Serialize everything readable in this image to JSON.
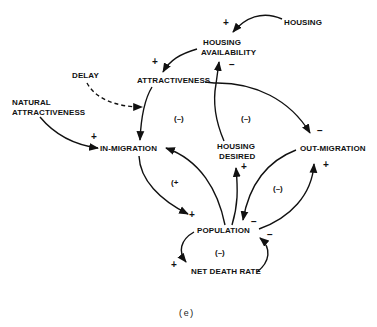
{
  "diagram": {
    "type": "causal-loop-diagram",
    "caption": "(e)",
    "nodes": {
      "housing": "HOUSING",
      "housing_availability_1": "HOUSING",
      "housing_availability_2": "AVAILABILITY",
      "attractiveness": "ATTRACTIVENESS",
      "delay": "DELAY",
      "natural_attractiveness_1": "NATURAL",
      "natural_attractiveness_2": "ATTRACTIVENESS",
      "in_migration": "IN-MIGRATION",
      "housing_desired_1": "HOUSING",
      "housing_desired_2": "DESIRED",
      "out_migration": "OUT-MIGRATION",
      "population": "POPULATION",
      "net_death_rate": "NET DEATH RATE"
    },
    "signs": {
      "housing_to_availability": "+",
      "availability_to_attractiveness": "+",
      "desired_to_availability": "−",
      "natural_to_inmigration": "+",
      "attractiveness_to_outmigration": "−",
      "population_to_desired": "+",
      "inmigration_to_population": "+",
      "population_to_outmigration": "+",
      "outmigration_to_population": "−",
      "deathrate_to_population": "−",
      "population_to_deathrate": "+"
    },
    "loops": {
      "left_attractiveness": "(–)",
      "center_housing": "(–)",
      "inmigration_population": "(+",
      "outmigration_population": "(–)",
      "death_rate": "(–)"
    }
  }
}
